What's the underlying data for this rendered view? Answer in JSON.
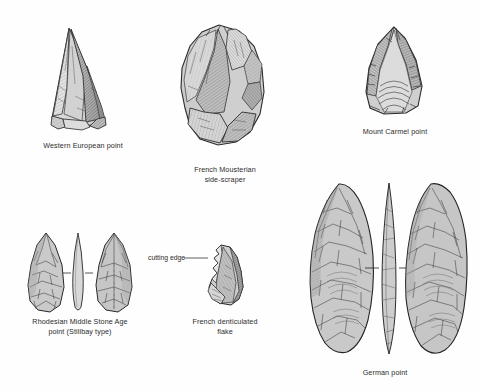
{
  "plate": {
    "title": "Stone tool types plate",
    "background_color": "#fefefe",
    "ink_color": "#2b2b2b",
    "stone_fill_light": "#d9d9d9",
    "stone_fill_mid": "#b9b9b9",
    "stone_fill_dark": "#8f8f8f"
  },
  "figures": [
    {
      "id": "western-european-point",
      "caption": "Western European point",
      "views": 1,
      "caption_x": 18,
      "caption_y": 141,
      "caption_w": 130
    },
    {
      "id": "french-mousterian-side-scraper",
      "caption": "French Mousterian\nside-scraper",
      "views": 1,
      "caption_x": 155,
      "caption_y": 165,
      "caption_w": 140
    },
    {
      "id": "mount-carmel-point",
      "caption": "Mount Carmel point",
      "views": 1,
      "caption_x": 330,
      "caption_y": 127,
      "caption_w": 130
    },
    {
      "id": "rhodesian-middle-stone-age-point",
      "caption": "Rhodesian Middle Stone Age\npoint (Stillbay type)",
      "views": 3,
      "caption_x": 5,
      "caption_y": 317,
      "caption_w": 150
    },
    {
      "id": "french-denticulated-flake",
      "caption": "French denticulated\nflake",
      "views": 1,
      "caption_x": 170,
      "caption_y": 317,
      "caption_w": 110
    },
    {
      "id": "german-point",
      "caption": "German point",
      "views": 3,
      "caption_x": 330,
      "caption_y": 368,
      "caption_w": 110
    }
  ],
  "annotations": [
    {
      "id": "cutting-edge",
      "label": "cutting edge",
      "label_x": 148,
      "label_y": 254,
      "leader_from_x": 186,
      "leader_to_x": 207,
      "leader_y": 258
    }
  ]
}
